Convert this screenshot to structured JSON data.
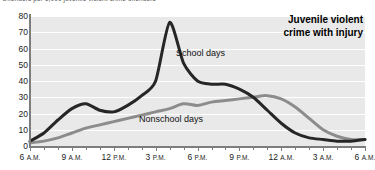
{
  "caption": "Offenders per 1,000 juvenile violent crime offenders",
  "title_line1": "Juvenile violent",
  "title_line2": "crime with injury",
  "colors": {
    "school_days": "#262626",
    "nonschool_days": "#8c8c8c",
    "plot_background": "#e9e9e9",
    "gridline": "#ffffff",
    "axis": "#7d7d7d"
  },
  "labels": {
    "school_days": "School days",
    "nonschool_days": "Nonschool days"
  },
  "axes": {
    "y_ticks": [
      "80",
      "70",
      "60",
      "50",
      "40",
      "30",
      "20",
      "10",
      "0"
    ],
    "x_ticks": [
      {
        "big": "6",
        "sm": "A.M."
      },
      {
        "big": "9",
        "sm": "A.M."
      },
      {
        "big": "12",
        "sm": "P.M."
      },
      {
        "big": "3",
        "sm": "P.M."
      },
      {
        "big": "6",
        "sm": "P.M."
      },
      {
        "big": "9",
        "sm": "P.M."
      },
      {
        "big": "12",
        "sm": "A.M."
      },
      {
        "big": "3",
        "sm": "A.M."
      },
      {
        "big": "6",
        "sm": "A.M."
      }
    ]
  },
  "chart_data": {
    "type": "line",
    "title": "Juvenile violent crime with injury",
    "subtitle": "Offenders per 1,000 juvenile violent crime offenders",
    "xlabel": "",
    "ylabel": "Offenders per 1,000 juvenile violent crime offenders",
    "ylim": [
      0,
      80
    ],
    "grid": true,
    "legend": "inline-annotations",
    "x": [
      "6 A.M.",
      "7 A.M.",
      "8 A.M.",
      "9 A.M.",
      "10 A.M.",
      "11 A.M.",
      "12 P.M.",
      "1 P.M.",
      "2 P.M.",
      "3 P.M.",
      "4 P.M.",
      "5 P.M.",
      "6 P.M.",
      "7 P.M.",
      "8 P.M.",
      "9 P.M.",
      "10 P.M.",
      "11 P.M.",
      "12 A.M.",
      "1 A.M.",
      "2 A.M.",
      "3 A.M.",
      "4 A.M.",
      "5 A.M.",
      "6 A.M."
    ],
    "series": [
      {
        "name": "School days",
        "color": "#262626",
        "values": [
          3,
          8,
          16,
          23,
          26,
          22,
          21,
          25,
          31,
          40,
          76,
          51,
          40,
          38,
          38,
          35,
          30,
          22,
          14,
          8,
          5,
          4,
          3,
          3,
          4
        ]
      },
      {
        "name": "Nonschool days",
        "color": "#8c8c8c",
        "values": [
          2,
          3,
          5,
          8,
          11,
          13,
          15,
          17,
          19,
          21,
          23,
          26,
          25,
          27,
          28,
          29,
          30,
          31,
          29,
          24,
          17,
          10,
          6,
          4,
          4
        ]
      }
    ]
  }
}
